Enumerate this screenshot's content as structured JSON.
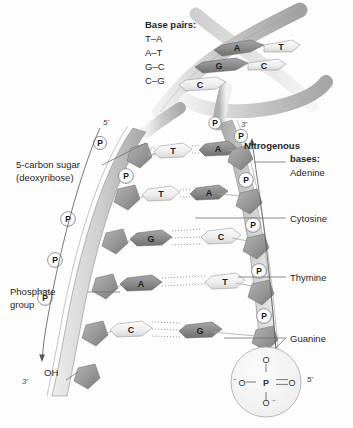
{
  "figure": {
    "title_legend": "Base pairs:",
    "base_pair_list": [
      "T–A",
      "A–T",
      "G–C",
      "C–G"
    ]
  },
  "labels": {
    "sugar_line1": "5-carbon sugar",
    "sugar_line2": "(deoxyribose)",
    "phosphate_line1": "Phosphate",
    "phosphate_line2": "group",
    "nitrogenous_line1": "Nitrogenous",
    "nitrogenous_line2": "bases:",
    "adenine": "Adenine",
    "cytosine": "Cytosine",
    "thymine": "Thymine",
    "guanine": "Guanine",
    "hydroxyl": "OH"
  },
  "strand_ends": {
    "top_left": "5'",
    "top_right": "3'",
    "bottom_left": "3'",
    "bottom_right": "5'"
  },
  "helix_bases": [
    {
      "left": "A",
      "right": "T"
    },
    {
      "left": "G",
      "right": "C"
    },
    {
      "left": "C",
      "right": ""
    }
  ],
  "ladder_rungs": [
    {
      "left": "T",
      "right": "A",
      "bonds": 2
    },
    {
      "left": "T",
      "right": "A",
      "bonds": 2
    },
    {
      "left": "G",
      "right": "C",
      "bonds": 3
    },
    {
      "left": "A",
      "right": "T",
      "bonds": 2
    },
    {
      "left": "C",
      "right": "G",
      "bonds": 3
    }
  ],
  "phosphate_symbol": "P",
  "phosphate_detail": {
    "center": "P",
    "top": "O",
    "left": "O",
    "left_charge": "−",
    "right": "O",
    "bottom": "O",
    "bottom_charge": "−"
  },
  "colors": {
    "base_dark": "#8c8c8c",
    "base_light": "#f2f2f2",
    "backbone": "#c9c9c9",
    "sugar": "#9e9e9e",
    "phosphate_circle": "#ffffff",
    "text": "#262626",
    "ribbon": "#bdbdbd"
  }
}
